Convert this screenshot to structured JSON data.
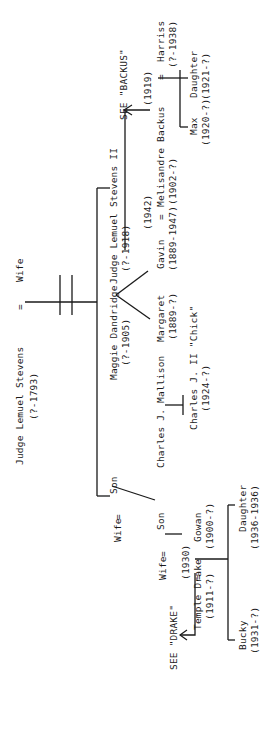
{
  "tree": {
    "root": {
      "name": "Judge Lemuel Stevens",
      "dates": "(?-1793)",
      "spouse": "Wife",
      "marriage_sign": "="
    },
    "gen2": {
      "maggie": {
        "name": "Maggie Dandridge",
        "dates": "(?-1905)"
      },
      "lemuel2": {
        "prefix": "=",
        "name": "Judge Lemuel Stevens II",
        "dates": "(?-1918)"
      },
      "son": {
        "name": "Son"
      }
    },
    "gen3": {
      "margaret": {
        "name": "Margaret",
        "dates": "(1889-?)"
      },
      "mallison": {
        "name": "Charles J. Mallison",
        "sign": "="
      },
      "gavin": {
        "name": "Gavin",
        "dates": "(1889-1947)"
      },
      "gavin_marriage": {
        "sign": "=",
        "year": "(1942)"
      },
      "melisandre": {
        "name": "Melisandre Backus",
        "dates": "(1902-?)"
      },
      "backus_marriage": {
        "year": "(1919)"
      },
      "harriss": {
        "name": "Harriss",
        "dates": "(?-1938)",
        "sign": "="
      },
      "see_backus": "SEE \"BACKUS\"",
      "wife": {
        "name": "Wife",
        "sign": "="
      },
      "son": {
        "name": "Son"
      }
    },
    "gen4": {
      "chick": {
        "name": "Charles J. II \"Chick\"",
        "dates": "(1924-?)"
      },
      "max": {
        "name": "Max",
        "dates": "(1920-?)"
      },
      "daughter": {
        "name": "Daughter",
        "dates": "(1921-?)"
      },
      "wife": {
        "name": "Wife",
        "sign": "="
      },
      "gowan": {
        "name": "Gowan",
        "dates": "(1900-?)"
      },
      "gowan_marriage": {
        "year": "(1930)"
      },
      "temple": {
        "name": "Temple Drake",
        "dates": "(1911-?)",
        "sign": "="
      },
      "see_drake": "SEE \"DRAKE\""
    },
    "gen5": {
      "bucky": {
        "name": "Bucky",
        "dates": "(1931-?)"
      },
      "daughter": {
        "name": "Daughter",
        "dates": "(1936-1936)"
      }
    }
  }
}
